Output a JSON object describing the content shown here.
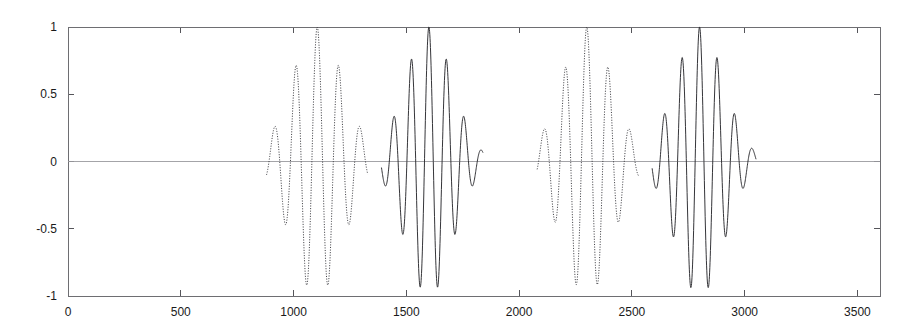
{
  "chart_data": {
    "type": "line",
    "title": "",
    "subtitle": "",
    "xlabel": "",
    "ylabel": "",
    "xlim": [
      0,
      3600
    ],
    "ylim": [
      -1,
      1
    ],
    "grid": false,
    "legend": null,
    "x_ticks": [
      0,
      500,
      1000,
      1500,
      2000,
      2500,
      3000,
      3500
    ],
    "x_tick_labels": [
      "0",
      "500",
      "1000",
      "1500",
      "2000",
      "2500",
      "3000",
      "3500"
    ],
    "y_ticks": [
      -1,
      -0.5,
      0,
      0.5,
      1
    ],
    "y_tick_labels": [
      "-1",
      "-0.5",
      "0",
      "0.5",
      "1"
    ],
    "baseline": 0,
    "series": [
      {
        "name": "dotted-packet-1",
        "style": "dotted",
        "color": "#3a3a3f",
        "center": 1105,
        "envelope_width": 115,
        "period": 95,
        "phase": 0,
        "peak_amplitude": 1.0,
        "x_start": 880,
        "x_end": 1330,
        "notable_extrema": [
          {
            "x": 1010,
            "y": 0.41
          },
          {
            "x": 1058,
            "y": -0.7
          },
          {
            "x": 1105,
            "y": 0.99
          },
          {
            "x": 1152,
            "y": -0.84
          },
          {
            "x": 1200,
            "y": 0.53
          },
          {
            "x": 1248,
            "y": -0.16
          }
        ]
      },
      {
        "name": "solid-packet-2",
        "style": "solid",
        "color": "#2a2a2e",
        "center": 1600,
        "envelope_width": 105,
        "period": 78,
        "phase": 0,
        "peak_amplitude": 1.0,
        "x_start": 1390,
        "x_end": 1840,
        "notable_extrema": [
          {
            "x": 1483,
            "y": 0.4
          },
          {
            "x": 1522,
            "y": -0.66
          },
          {
            "x": 1561,
            "y": 0.88
          },
          {
            "x": 1600,
            "y": -1.0
          },
          {
            "x": 1639,
            "y": 0.92
          },
          {
            "x": 1678,
            "y": -0.7
          },
          {
            "x": 1717,
            "y": 0.38
          },
          {
            "x": 1756,
            "y": -0.15
          }
        ]
      },
      {
        "name": "dotted-packet-3",
        "style": "dotted",
        "color": "#3a3a3f",
        "center": 2300,
        "envelope_width": 112,
        "period": 95,
        "phase": 0,
        "peak_amplitude": 1.0,
        "x_start": 2080,
        "x_end": 2530,
        "notable_extrema": [
          {
            "x": 2205,
            "y": 0.16
          },
          {
            "x": 2252,
            "y": -0.38
          },
          {
            "x": 2300,
            "y": 0.76
          },
          {
            "x": 2348,
            "y": -1.0
          },
          {
            "x": 2395,
            "y": 0.79
          },
          {
            "x": 2443,
            "y": -0.34
          },
          {
            "x": 2490,
            "y": 0.12
          }
        ]
      },
      {
        "name": "solid-packet-4",
        "style": "solid",
        "color": "#2a2a2e",
        "center": 2800,
        "envelope_width": 108,
        "period": 78,
        "phase": 0,
        "peak_amplitude": 1.0,
        "x_start": 2590,
        "x_end": 3050,
        "notable_extrema": [
          {
            "x": 2683,
            "y": 0.38
          },
          {
            "x": 2722,
            "y": -0.64
          },
          {
            "x": 2761,
            "y": 0.87
          },
          {
            "x": 2800,
            "y": -1.0
          },
          {
            "x": 2839,
            "y": 0.96
          },
          {
            "x": 2878,
            "y": -0.74
          },
          {
            "x": 2917,
            "y": 0.4
          },
          {
            "x": 2956,
            "y": -0.16
          }
        ]
      }
    ]
  },
  "colors": {
    "background": "#ffffff",
    "axis": "#6e6e72",
    "tick_label": "#1a1a1a",
    "zero_line": "#9a9a9e",
    "solid_series": "#2a2a2e",
    "dotted_series": "#3a3a3f"
  }
}
